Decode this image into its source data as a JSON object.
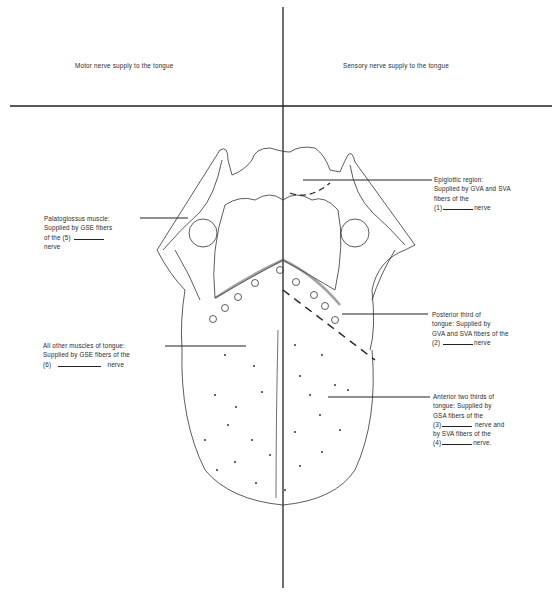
{
  "headers": {
    "left": "Motor nerve supply to the tongue",
    "right": "Sensory nerve supply to the tongue"
  },
  "labels": {
    "palatoglossus": {
      "line1": "Palatoglossus muscle:",
      "line2": "Supplied by GSE fibers",
      "line3_prefix": "of the (5)",
      "line4": "nerve"
    },
    "other_muscles": {
      "line1": "All other muscles of tongue:",
      "line2": "Supplied by GSE fibers of the",
      "line3_prefix": "(6)",
      "line3_suffix": "nerve"
    },
    "epiglottic": {
      "line1": "Epiglottic region:",
      "line2": "Supplied by GVA and SVA",
      "line3": "fibers of the",
      "line4_prefix": "(1)",
      "line4_suffix": "nerve"
    },
    "posterior": {
      "line1": "Posterior third of",
      "line2": "tongue: Supplied by",
      "line3": "GVA and SVA fibers of the",
      "line4_prefix": "(2)",
      "line4_suffix": "nerve"
    },
    "anterior": {
      "line1": "Anterior two thirds of",
      "line2": "tongue: Supplied by",
      "line3": "GSA fibers of the",
      "line4_prefix": "(3)",
      "line4_suffix": "nerve and",
      "line5": "by SVA fibers of the",
      "line6_prefix": "(4)",
      "line6_suffix": "nerve."
    }
  },
  "colors": {
    "ink": "#222222",
    "background": "#ffffff"
  }
}
